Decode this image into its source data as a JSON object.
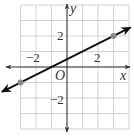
{
  "chart_data": {
    "type": "line",
    "title": "",
    "xlabel": "x",
    "ylabel": "y",
    "origin_label": "O",
    "xlim": [
      -3,
      4
    ],
    "ylim": [
      -4,
      4
    ],
    "grid": true,
    "x_tick_labels": [
      {
        "value": -2,
        "label": "−2"
      },
      {
        "value": 2,
        "label": "2"
      }
    ],
    "y_tick_labels": [
      {
        "value": 2,
        "label": "2"
      },
      {
        "value": -2,
        "label": "−2"
      }
    ],
    "series": [
      {
        "name": "line",
        "equation": "y = 0.5x + 0.5",
        "slope": 0.5,
        "intercept": 0.5,
        "color": "#111111",
        "arrows_both_ends": true,
        "marked_points": [
          {
            "x": -3,
            "y": -1
          },
          {
            "x": 3,
            "y": 2
          }
        ]
      }
    ],
    "point_color": "#8a8a8a"
  }
}
